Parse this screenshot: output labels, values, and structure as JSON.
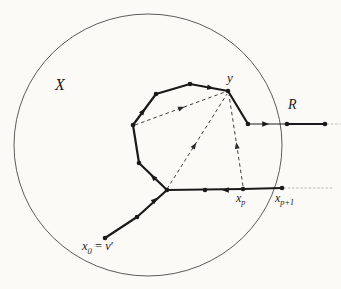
{
  "colors": {
    "ink": "#1e1e1e",
    "walk": "#1a1a1a",
    "circle": "#4a4a4a",
    "dashed": "#2a2a2a",
    "faint": "#b9b9ae",
    "paper": "#fbfaf6"
  },
  "labels": {
    "X": {
      "text": "X",
      "x": 55,
      "y": 77,
      "size": 16
    },
    "y": {
      "text": "y",
      "x": 227,
      "y": 71,
      "size": 13
    },
    "R": {
      "text": "R",
      "x": 288,
      "y": 98,
      "size": 14
    },
    "xp": {
      "base": "x",
      "sub": "p",
      "x": 236,
      "y": 192,
      "size": 12
    },
    "xp1": {
      "base": "x",
      "sub": "p+1",
      "x": 275,
      "y": 192,
      "size": 12
    },
    "x0": {
      "base": "x",
      "sub": "0",
      "eq": " = ",
      "v": "v",
      "prime": "′",
      "x": 82,
      "y": 240,
      "size": 12.5
    }
  },
  "diagram": {
    "width": 341,
    "height": 289,
    "circle": {
      "cx": 148,
      "cy": 145,
      "rx": 134,
      "ry": 131,
      "stroke_width": 0.9
    },
    "walk_stroke_width": 2.2,
    "thin_stroke_width": 1.2,
    "dashed_stroke_width": 0.9,
    "dot_radius": 2.3,
    "walk_segments": [
      {
        "name": "entry-from-x0",
        "points": [
          [
            105,
            238
          ],
          [
            137,
            217
          ],
          [
            167,
            190
          ]
        ]
      },
      {
        "name": "polygon-left-top",
        "points": [
          [
            167,
            190
          ],
          [
            139,
            163
          ],
          [
            133,
            125
          ],
          [
            156,
            94
          ],
          [
            190,
            84
          ],
          [
            228,
            91
          ]
        ]
      },
      {
        "name": "y-to-ray",
        "points": [
          [
            228,
            91
          ],
          [
            248,
            124
          ]
        ]
      },
      {
        "name": "ray-thick-part",
        "points": [
          [
            287,
            124
          ],
          [
            325,
            124
          ]
        ]
      },
      {
        "name": "bottom-line",
        "points": [
          [
            167,
            190
          ],
          [
            243,
            189
          ],
          [
            282,
            188
          ]
        ]
      }
    ],
    "thin_segments": [
      {
        "name": "ray-thin-part",
        "points": [
          [
            248,
            124
          ],
          [
            287,
            124
          ]
        ]
      }
    ],
    "faint_segments": [
      {
        "name": "ray-continuation",
        "points": [
          [
            327,
            124
          ],
          [
            340,
            124
          ]
        ]
      },
      {
        "name": "bottom-continuation",
        "points": [
          [
            284,
            188
          ],
          [
            333,
            188
          ]
        ]
      }
    ],
    "dots": [
      [
        105,
        238
      ],
      [
        137,
        217
      ],
      [
        167,
        190
      ],
      [
        139,
        163
      ],
      [
        133,
        125
      ],
      [
        156,
        94
      ],
      [
        190,
        84
      ],
      [
        228,
        91
      ],
      [
        248,
        124
      ],
      [
        287,
        124
      ],
      [
        325,
        124
      ],
      [
        205,
        190
      ],
      [
        243,
        189
      ],
      [
        282,
        188
      ]
    ],
    "solid_arrows": [
      {
        "x": 156,
        "y": 199,
        "angle": -42
      },
      {
        "x": 152,
        "y": 176,
        "angle": -136
      },
      {
        "x": 144,
        "y": 110,
        "angle": -53
      },
      {
        "x": 212,
        "y": 88,
        "angle": 10
      },
      {
        "x": 267,
        "y": 124,
        "angle": 0
      },
      {
        "x": 224,
        "y": 190,
        "angle": 180
      }
    ],
    "dashed_arrows": [
      {
        "x1": 135,
        "y1": 125,
        "x2": 225,
        "y2": 92,
        "t": 0.53
      },
      {
        "x1": 167,
        "y1": 189,
        "x2": 227,
        "y2": 94,
        "t": 0.47
      },
      {
        "x1": 243,
        "y1": 186,
        "x2": 229,
        "y2": 95,
        "t": 0.46
      }
    ]
  }
}
